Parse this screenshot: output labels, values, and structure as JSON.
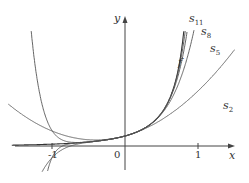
{
  "chart_data": {
    "type": "line",
    "title": "",
    "xlabel": "x",
    "ylabel": "y",
    "xlim": [
      -1.6,
      1.5
    ],
    "ylim": [
      -4,
      13
    ],
    "xticks": [
      "-1",
      "0",
      "1"
    ],
    "grid": false,
    "series": [
      {
        "name": "f",
        "formula": "e^x/(1-x)",
        "label_pos": [
          0.45,
          7.6
        ]
      },
      {
        "name": "s_2",
        "degree": 2,
        "label_pos": [
          1.33,
          2.5
        ]
      },
      {
        "name": "s_5",
        "degree": 5,
        "label_pos": [
          1.2,
          9.3
        ]
      },
      {
        "name": "s_8",
        "degree": 8,
        "label_pos": [
          1.05,
          11.3
        ]
      },
      {
        "name": "s_11",
        "degree": 11,
        "label_pos": [
          0.95,
          12.8
        ]
      }
    ]
  },
  "labels": {
    "x_axis": "x",
    "y_axis": "y",
    "origin": "0",
    "tick_pos": "1",
    "tick_neg": "-1",
    "f": "f",
    "s2": "s",
    "s2_sub": "2",
    "s5": "s",
    "s5_sub": "5",
    "s8": "s",
    "s8_sub": "8",
    "s11": "s",
    "s11_sub": "11"
  }
}
